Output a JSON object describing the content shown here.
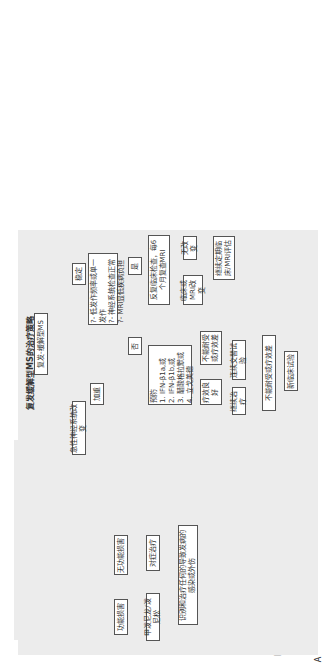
{
  "panel_a": {
    "label": "A",
    "title": "复发缓解型MS的治疗策略",
    "root": "复发-缓解型MS",
    "acute": "急性神经系统改变",
    "worsen": "加重",
    "chronic_worsen": "慢性加重",
    "functional_disability": "功能损害",
    "no_functional_disability": "无功能损害",
    "steroids": "甲泼尼龙/泼尼松",
    "symptomatic": "对症治疗",
    "identify": "识别和治疗任何的导致发病的感染或外伤",
    "stable": "稳定",
    "criteria": [
      "?- 低发作频率或单一发作",
      "?- 神经系统检查正常",
      "?- MRI显低疾病负担"
    ],
    "yes": "是",
    "no": "否",
    "monitor": "反复临床检查，每6个月复查MRI",
    "clinical_mri_change": "临床或MRI改变",
    "no_change": "无改变",
    "continue_eval": "继续定期临床/MRI评估",
    "prevention_title": "预防",
    "prevention": [
      "1. IFN-β1a,或",
      "2. IFN-β1b,或",
      "3. 醋酸格拉默或",
      "4. 立戈美德"
    ],
    "good_response": "疗效良好",
    "intolerant": "不能耐受或疗效差",
    "continue_treatment": "继续治疗",
    "switch_trial": "连续交替试验",
    "intolerant2": "不能耐受或疗效差",
    "consider_trial": "新临床试验"
  },
  "panel_b": {
    "label": "B",
    "title": "进展型MS的治疗策略",
    "root": "进展型MS",
    "secondary": "继发进展型 MS",
    "primary": "原发进展型 MS",
    "symptomatic": "对症治疗",
    "with_relapse": "伴有复发",
    "without_relapse": "不伴有复发",
    "no_proven": "没有已被证实的治疗",
    "consider": "考虑",
    "ifn": [
      "1. IFN-β1a,或",
      "2. IFN-β1b"
    ],
    "intolerant": "不能耐受或疗效差",
    "options_title": "考虑采取下列治疗的一种：",
    "options": [
      "1. 米托蒽醌",
      "2. 硫唑嘌呤",
      "3. 氨甲蝶呤",
      "4. 环磷酰胺冲击",
      "5. IVIg",
      "6. 甲泼尼龙冲击"
    ]
  }
}
